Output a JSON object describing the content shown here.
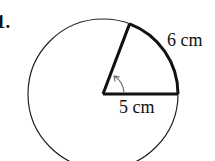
{
  "problem": {
    "number": "1."
  },
  "figure": {
    "type": "circle-sector",
    "radius_label": "5 cm",
    "arc_label": "6 cm",
    "center": [
      103,
      94
    ],
    "radius": 75
  }
}
